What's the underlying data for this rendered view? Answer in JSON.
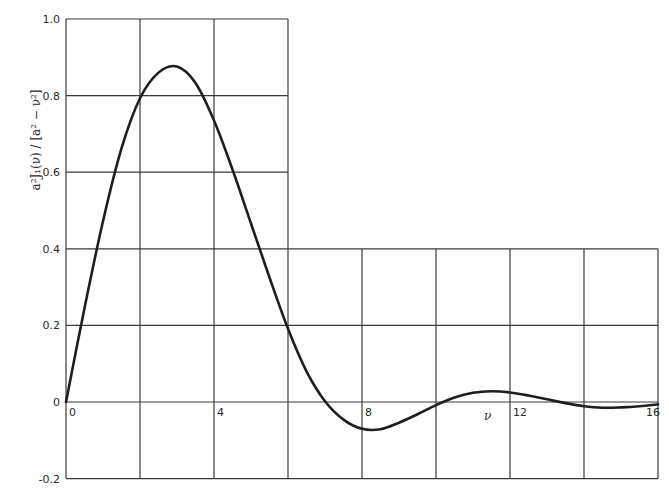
{
  "chart_data": {
    "type": "line",
    "title": "",
    "xlabel": "ν",
    "ylabel": "a²J₁(ν) / [a² − ν²]",
    "xlim": [
      0,
      16
    ],
    "ylim": [
      -0.2,
      1.0
    ],
    "grid": true,
    "x_ticks": [
      "0",
      "4",
      "8",
      "12",
      "16"
    ],
    "y_ticks": [
      "1.0",
      "0.8",
      "0.6",
      "0.4",
      "0.2",
      "0",
      "-0.2"
    ],
    "grid_note": "Upper grid (y 0.4–1.0) spans only ν 0–6; lower grid (y −0.2–0.4) spans ν 0–16; gridlines every 2 units in ν and 0.2 in y",
    "series": [
      {
        "name": "a²J₁(ν)/[a² − ν²]",
        "x": [
          0,
          0.5,
          1,
          1.5,
          2,
          2.5,
          3,
          3.5,
          4,
          4.5,
          5,
          5.5,
          6,
          6.5,
          7,
          7.5,
          8,
          8.5,
          9,
          9.5,
          10,
          10.5,
          11,
          11.5,
          12,
          12.5,
          13,
          13.5,
          14,
          14.5,
          15,
          15.5,
          16
        ],
        "y": [
          0,
          0.245,
          0.472,
          0.662,
          0.793,
          0.86,
          0.876,
          0.833,
          0.735,
          0.607,
          0.466,
          0.325,
          0.191,
          0.08,
          0.002,
          -0.046,
          -0.07,
          -0.071,
          -0.054,
          -0.032,
          -0.008,
          0.012,
          0.024,
          0.028,
          0.025,
          0.017,
          0.007,
          -0.003,
          -0.011,
          -0.015,
          -0.014,
          -0.011,
          -0.006
        ]
      }
    ]
  }
}
